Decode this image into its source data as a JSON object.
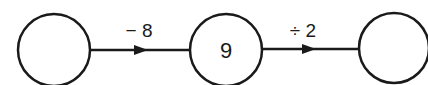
{
  "diagram": {
    "nodes": [
      {
        "id": "input",
        "value": ""
      },
      {
        "id": "middle",
        "value": "9"
      },
      {
        "id": "output",
        "value": ""
      }
    ],
    "edges": [
      {
        "from": "input",
        "to": "middle",
        "operation": "− 8"
      },
      {
        "from": "middle",
        "to": "output",
        "operation": "÷ 2"
      }
    ],
    "colors": {
      "stroke": "#1a1a1a",
      "background": "#ffffff"
    }
  }
}
